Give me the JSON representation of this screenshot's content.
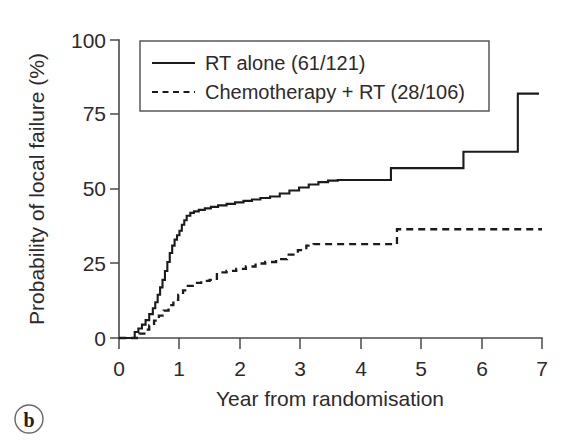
{
  "figure": {
    "panel_label": "b",
    "background_color": "#ffffff",
    "ink_color": "#1c1a1a"
  },
  "chart_data": {
    "type": "line",
    "title": "",
    "subtitle": "",
    "xlabel": "Year from randomisation",
    "ylabel": "Probability of local failure (%)",
    "xlim": [
      0,
      7
    ],
    "ylim": [
      0,
      100
    ],
    "xticks": [
      0,
      1,
      2,
      3,
      4,
      5,
      6,
      7
    ],
    "xtick_labels": [
      "0",
      "1",
      "2",
      "3",
      "4",
      "5",
      "6",
      "7"
    ],
    "yticks": [
      0,
      25,
      50,
      75,
      100
    ],
    "ytick_labels": [
      "0",
      "25",
      "50",
      "75",
      "100"
    ],
    "grid": false,
    "legend_position": "upper-left-inside",
    "step_style": "post",
    "series": [
      {
        "name": "RT alone (61/121)",
        "label": "RT alone",
        "events": 61,
        "total": 121,
        "line_style": "solid",
        "color": "#1c1a1a",
        "x": [
          0,
          0.18,
          0.26,
          0.32,
          0.38,
          0.44,
          0.5,
          0.56,
          0.6,
          0.64,
          0.68,
          0.72,
          0.76,
          0.8,
          0.84,
          0.88,
          0.92,
          0.96,
          1.0,
          1.04,
          1.08,
          1.12,
          1.18,
          1.24,
          1.32,
          1.42,
          1.52,
          1.64,
          1.78,
          1.92,
          2.06,
          2.2,
          2.34,
          2.5,
          2.66,
          2.82,
          2.98,
          3.14,
          3.3,
          3.46,
          3.62,
          4.5,
          5.7,
          6.6,
          6.95
        ],
        "y": [
          0,
          0,
          2.0,
          3.2,
          4.5,
          6.0,
          8.0,
          10.0,
          12.0,
          14.5,
          17.0,
          19.5,
          22.5,
          25.5,
          28.5,
          31.0,
          33.0,
          34.5,
          36.0,
          38.0,
          39.5,
          41.0,
          42.0,
          42.5,
          43.0,
          43.5,
          44.0,
          44.5,
          45.0,
          45.5,
          46.0,
          46.5,
          47.0,
          47.5,
          48.5,
          49.5,
          50.5,
          51.5,
          52.3,
          52.8,
          53.0,
          57.0,
          62.5,
          82.0,
          82.0
        ]
      },
      {
        "name": "Chemotherapy + RT (28/106)",
        "label": "Chemotherapy + RT",
        "events": 28,
        "total": 106,
        "line_style": "dashed",
        "color": "#1c1a1a",
        "x": [
          0,
          0.25,
          0.34,
          0.42,
          0.5,
          0.58,
          0.66,
          0.74,
          0.82,
          0.9,
          0.98,
          1.06,
          1.14,
          1.24,
          1.36,
          1.5,
          1.62,
          1.78,
          1.94,
          2.1,
          2.26,
          2.42,
          2.6,
          2.78,
          2.96,
          3.1,
          3.22,
          4.48,
          4.6,
          7.0
        ],
        "y": [
          0,
          0,
          1.5,
          2.8,
          4.2,
          5.8,
          7.5,
          9.2,
          11.0,
          12.8,
          14.5,
          16.0,
          17.5,
          18.5,
          19.2,
          19.5,
          22.0,
          22.5,
          23.2,
          24.0,
          25.0,
          25.5,
          26.5,
          28.0,
          29.5,
          31.0,
          31.5,
          31.5,
          36.5,
          36.5
        ]
      }
    ],
    "legend_entries": [
      {
        "label": "RT alone (61/121)",
        "line_style": "solid"
      },
      {
        "label": "Chemotherapy + RT (28/106)",
        "line_style": "dashed"
      }
    ]
  }
}
